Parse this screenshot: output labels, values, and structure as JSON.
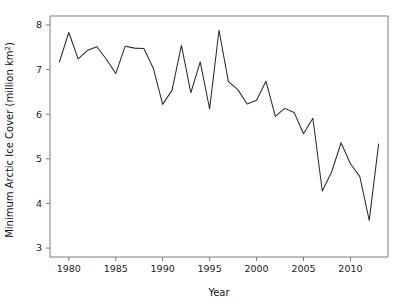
{
  "chart_data": {
    "type": "line",
    "title": "",
    "xlabel": "Year",
    "ylabel": "Minimum Arctic Ice Cover (million km²)",
    "ylabel_main": "Minimum Arctic Ice Cover (million km",
    "ylabel_sup": "2",
    "ylabel_tail": ")",
    "grid": false,
    "legend": "none",
    "xlim": [
      1978,
      2014
    ],
    "ylim": [
      2.8,
      8.2
    ],
    "xticks": [
      1980,
      1985,
      1990,
      1995,
      2000,
      2005,
      2010
    ],
    "xtick_labels": [
      "1980",
      "1985",
      "1990",
      "1995",
      "2000",
      "2005",
      "2010"
    ],
    "yticks": [
      3,
      4,
      5,
      6,
      7,
      8
    ],
    "ytick_labels": [
      "3",
      "4",
      "5",
      "6",
      "7",
      "8"
    ],
    "line_color": "#2b2b2b",
    "axis_color": "#7d7d7d",
    "background_color": "#ffffff",
    "x": [
      1979,
      1980,
      1981,
      1982,
      1983,
      1984,
      1985,
      1986,
      1987,
      1988,
      1989,
      1990,
      1991,
      1992,
      1993,
      1994,
      1995,
      1996,
      1997,
      1998,
      1999,
      2000,
      2001,
      2002,
      2003,
      2004,
      2005,
      2006,
      2007,
      2008,
      2009,
      2010,
      2011,
      2012,
      2013
    ],
    "values": [
      7.17,
      7.83,
      7.24,
      7.43,
      7.51,
      7.23,
      6.91,
      7.52,
      7.48,
      7.47,
      7.03,
      6.22,
      6.54,
      7.54,
      6.48,
      7.17,
      6.12,
      7.88,
      6.73,
      6.55,
      6.23,
      6.31,
      6.74,
      5.95,
      6.13,
      6.04,
      5.56,
      5.91,
      4.28,
      4.71,
      5.36,
      4.89,
      4.6,
      3.62,
      5.33
    ]
  },
  "figure": {
    "x_axis_title": "Year"
  }
}
